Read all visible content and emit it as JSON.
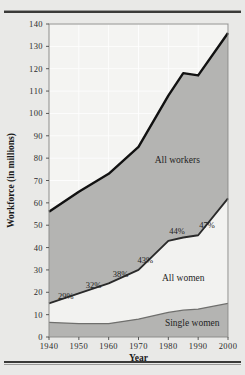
{
  "chart_data": {
    "type": "area",
    "title": "",
    "xlabel": "Year",
    "ylabel": "Workforce (in millions)",
    "x": [
      1940,
      1950,
      1960,
      1970,
      1980,
      1985,
      1990,
      2000
    ],
    "xlim": [
      1940,
      2000
    ],
    "ylim": [
      0,
      140
    ],
    "ytick_labels": [
      "0",
      "10",
      "20",
      "30",
      "40",
      "50",
      "60",
      "70",
      "80",
      "90",
      "100",
      "110",
      "120",
      "130",
      "140"
    ],
    "ytick_values": [
      0,
      10,
      20,
      30,
      40,
      50,
      60,
      70,
      80,
      90,
      100,
      110,
      120,
      130,
      140
    ],
    "xtick_labels": [
      "1940",
      "1950",
      "1960",
      "1970",
      "1980",
      "1990",
      "2000"
    ],
    "xtick_values": [
      1940,
      1950,
      1960,
      1970,
      1980,
      1990,
      2000
    ],
    "grid": true,
    "legend_position": "inline-annotations",
    "series": [
      {
        "name": "All workers",
        "label": "All workers",
        "color": "#b4b4b2",
        "line_color": "#111111",
        "values": [
          56,
          65,
          73,
          85,
          108,
          118,
          117,
          136
        ]
      },
      {
        "name": "All women",
        "label": "All women",
        "color": "#f2f2f0",
        "line_color": "#2a2a2a",
        "values": [
          15,
          19.5,
          24,
          30,
          43,
          44.5,
          45.5,
          62
        ]
      },
      {
        "name": "Single women",
        "label": "Single women",
        "color": "#b4b4b2",
        "line_color": "#6f6f6d",
        "values": [
          6.5,
          6,
          6,
          8,
          11,
          12,
          12.5,
          15
        ]
      }
    ],
    "annotations": [
      {
        "text": "29%",
        "x": 1940,
        "y": 15
      },
      {
        "text": "32%",
        "x": 1950,
        "y": 19.5
      },
      {
        "text": "38%",
        "x": 1960,
        "y": 24
      },
      {
        "text": "43%",
        "x": 1970,
        "y": 30
      },
      {
        "text": "44%",
        "x": 1980,
        "y": 43
      },
      {
        "text": "47%",
        "x": 1990,
        "y": 45.5
      }
    ]
  }
}
